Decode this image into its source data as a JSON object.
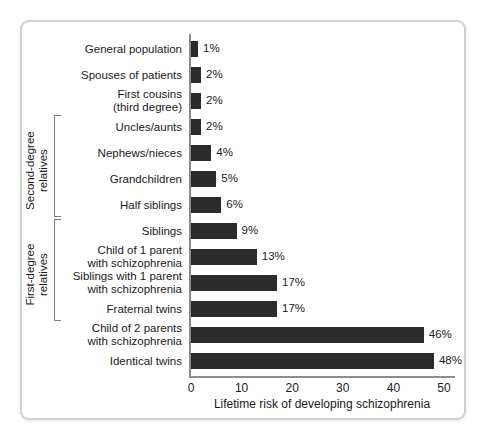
{
  "chart_data": {
    "type": "bar",
    "orientation": "horizontal",
    "title": "",
    "xlabel": "Lifetime risk of developing schizophrenia",
    "ylabel": "",
    "xlim": [
      0,
      50
    ],
    "xticks": [
      0,
      10,
      20,
      30,
      40,
      50
    ],
    "xtick_labels": [
      "0",
      "10",
      "20",
      "30",
      "40",
      "50"
    ],
    "grid": false,
    "legend": false,
    "bar_color": "#2b2b2b",
    "axis_color": "#8d8d8d",
    "value_suffix": "%",
    "categories": [
      "General population",
      "Spouses of patients",
      "First cousins\n(third degree)",
      "Uncles/aunts",
      "Nephews/nieces",
      "Grandchildren",
      "Half siblings",
      "Siblings",
      "Child of 1 parent\nwith schizophrenia",
      "Siblings with 1 parent\nwith schizophrenia",
      "Fraternal twins",
      "Child of 2 parents\nwith schizophrenia",
      "Identical twins"
    ],
    "values": [
      1,
      2,
      2,
      2,
      4,
      5,
      6,
      9,
      13,
      17,
      17,
      46,
      48
    ],
    "value_labels": [
      "1%",
      "2%",
      "2%",
      "2%",
      "4%",
      "5%",
      "6%",
      "9%",
      "13%",
      "17%",
      "17%",
      "46%",
      "48%"
    ],
    "groups": [
      {
        "label": "Second-degree\nrelatives",
        "first_index": 3,
        "last_index": 6
      },
      {
        "label": "First-degree\nrelatives",
        "first_index": 7,
        "last_index": 10
      }
    ]
  }
}
